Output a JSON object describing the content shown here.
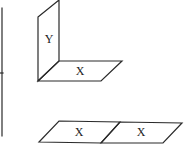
{
  "diagram": {
    "figure_l_shape": {
      "vertical_plane_label": "Y",
      "horizontal_plane_label": "X"
    },
    "figure_two_planes": {
      "left_plane_label": "X",
      "right_plane_label": "X"
    }
  },
  "colors": {
    "line": "#2a2a2a",
    "background": "#ffffff"
  }
}
